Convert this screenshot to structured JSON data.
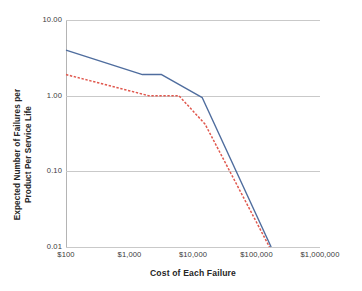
{
  "chart_data": {
    "type": "line",
    "title": "",
    "xlabel": "Cost of Each Failure",
    "ylabel": "Expected Number of Failures per Product Per Service Life",
    "xscale": "log",
    "yscale": "log",
    "xlim": [
      100,
      1000000
    ],
    "ylim": [
      0.01,
      10.0
    ],
    "grid": true,
    "legend": "none",
    "x_tick_labels": [
      "$100",
      "$1,000",
      "$10,000",
      "$100,000",
      "$1,000,000"
    ],
    "x_tick_values": [
      100,
      1000,
      10000,
      100000,
      1000000
    ],
    "y_tick_labels": [
      "10.00",
      "1.00",
      "0.10",
      "0.01"
    ],
    "y_tick_values": [
      10.0,
      1.0,
      0.1,
      0.01
    ],
    "series": [
      {
        "name": "series-1",
        "style": "solid",
        "color": "#4f6d9e",
        "x": [
          100,
          1600,
          3200,
          14000,
          170000
        ],
        "y": [
          4.0,
          1.9,
          1.9,
          0.94,
          0.01
        ]
      },
      {
        "name": "series-2",
        "style": "dashed",
        "color": "#e0584e",
        "x": [
          100,
          2000,
          6000,
          15500,
          160000
        ],
        "y": [
          1.9,
          1.0,
          1.0,
          0.42,
          0.01
        ]
      }
    ]
  },
  "axis": {
    "x_title": "Cost of Each Failure",
    "y_title_line1": "Expected Number of Failures per",
    "y_title_line2": "Product Per Service Life"
  }
}
